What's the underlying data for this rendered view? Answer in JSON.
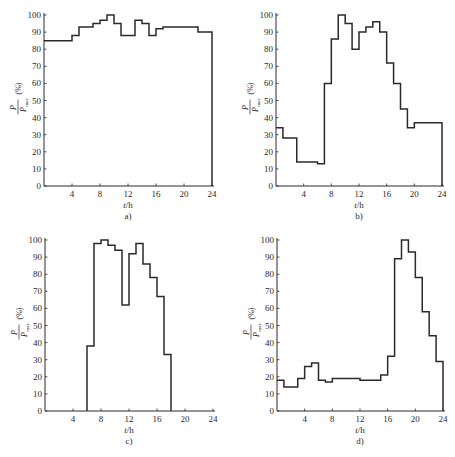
{
  "figure": {
    "caption": "",
    "y_label_numerator": "P",
    "y_label_denominator": "P",
    "y_label_denominator_sub": "max",
    "y_label_unit": "(%)",
    "x_label": "t/h"
  },
  "chart_data": [
    {
      "panel": "a)",
      "type": "line",
      "style": "step",
      "title": "",
      "xlabel": "t/h",
      "ylabel": "P/Pmax (%)",
      "xlim": [
        0,
        24
      ],
      "ylim": [
        0,
        100
      ],
      "xticks": [
        4,
        8,
        12,
        16,
        20,
        24
      ],
      "yticks": [
        0,
        10,
        20,
        30,
        40,
        50,
        60,
        70,
        80,
        90,
        100
      ],
      "grid": false,
      "boxed": true,
      "steps": [
        {
          "t0": 0,
          "t1": 4,
          "value": 85
        },
        {
          "t0": 4,
          "t1": 5,
          "value": 88
        },
        {
          "t0": 5,
          "t1": 7,
          "value": 93
        },
        {
          "t0": 7,
          "t1": 8,
          "value": 95
        },
        {
          "t0": 8,
          "t1": 9,
          "value": 97
        },
        {
          "t0": 9,
          "t1": 10,
          "value": 100
        },
        {
          "t0": 10,
          "t1": 11,
          "value": 95
        },
        {
          "t0": 11,
          "t1": 13,
          "value": 88
        },
        {
          "t0": 13,
          "t1": 14,
          "value": 97
        },
        {
          "t0": 14,
          "t1": 15,
          "value": 95
        },
        {
          "t0": 15,
          "t1": 16,
          "value": 88
        },
        {
          "t0": 16,
          "t1": 17,
          "value": 92
        },
        {
          "t0": 17,
          "t1": 22,
          "value": 93
        },
        {
          "t0": 22,
          "t1": 24,
          "value": 90
        }
      ]
    },
    {
      "panel": "b)",
      "type": "line",
      "style": "step",
      "title": "",
      "xlabel": "t/h",
      "ylabel": "P/Pmax (%)",
      "xlim": [
        0,
        24
      ],
      "ylim": [
        0,
        100
      ],
      "xticks": [
        4,
        8,
        12,
        16,
        20,
        24
      ],
      "yticks": [
        0,
        10,
        20,
        30,
        40,
        50,
        60,
        70,
        80,
        90,
        100
      ],
      "grid": false,
      "boxed": true,
      "steps": [
        {
          "t0": 0,
          "t1": 1,
          "value": 34
        },
        {
          "t0": 1,
          "t1": 3,
          "value": 28
        },
        {
          "t0": 3,
          "t1": 6,
          "value": 14
        },
        {
          "t0": 6,
          "t1": 7,
          "value": 13
        },
        {
          "t0": 7,
          "t1": 8,
          "value": 60
        },
        {
          "t0": 8,
          "t1": 9,
          "value": 86
        },
        {
          "t0": 9,
          "t1": 10,
          "value": 100
        },
        {
          "t0": 10,
          "t1": 11,
          "value": 95
        },
        {
          "t0": 11,
          "t1": 12,
          "value": 80
        },
        {
          "t0": 12,
          "t1": 13,
          "value": 90
        },
        {
          "t0": 13,
          "t1": 14,
          "value": 93
        },
        {
          "t0": 14,
          "t1": 15,
          "value": 96
        },
        {
          "t0": 15,
          "t1": 16,
          "value": 90
        },
        {
          "t0": 16,
          "t1": 17,
          "value": 72
        },
        {
          "t0": 17,
          "t1": 18,
          "value": 60
        },
        {
          "t0": 18,
          "t1": 19,
          "value": 45
        },
        {
          "t0": 19,
          "t1": 20,
          "value": 34
        },
        {
          "t0": 20,
          "t1": 24,
          "value": 37
        }
      ]
    },
    {
      "panel": "c)",
      "type": "line",
      "style": "step",
      "title": "",
      "xlabel": "t/h",
      "ylabel": "P/Pmax (%)",
      "xlim": [
        0,
        24
      ],
      "ylim": [
        0,
        100
      ],
      "xticks": [
        4,
        8,
        12,
        16,
        20,
        24
      ],
      "yticks": [
        0,
        10,
        20,
        30,
        40,
        50,
        60,
        70,
        80,
        90,
        100
      ],
      "grid": false,
      "boxed": false,
      "steps": [
        {
          "t0": 6,
          "t1": 7,
          "value": 38
        },
        {
          "t0": 7,
          "t1": 8,
          "value": 98
        },
        {
          "t0": 8,
          "t1": 9,
          "value": 100
        },
        {
          "t0": 9,
          "t1": 10,
          "value": 97
        },
        {
          "t0": 10,
          "t1": 11,
          "value": 94
        },
        {
          "t0": 11,
          "t1": 12,
          "value": 62
        },
        {
          "t0": 12,
          "t1": 13,
          "value": 92
        },
        {
          "t0": 13,
          "t1": 14,
          "value": 98
        },
        {
          "t0": 14,
          "t1": 15,
          "value": 86
        },
        {
          "t0": 15,
          "t1": 16,
          "value": 78
        },
        {
          "t0": 16,
          "t1": 17,
          "value": 67
        },
        {
          "t0": 17,
          "t1": 18,
          "value": 33
        }
      ]
    },
    {
      "panel": "d)",
      "type": "line",
      "style": "step",
      "title": "",
      "xlabel": "t/h",
      "ylabel": "P/Pmax (%)",
      "xlim": [
        0,
        24
      ],
      "ylim": [
        0,
        100
      ],
      "xticks": [
        4,
        8,
        12,
        16,
        20,
        24
      ],
      "yticks": [
        0,
        10,
        20,
        30,
        40,
        50,
        60,
        70,
        80,
        90,
        100
      ],
      "grid": false,
      "boxed": true,
      "steps": [
        {
          "t0": 0,
          "t1": 1,
          "value": 18
        },
        {
          "t0": 1,
          "t1": 3,
          "value": 14
        },
        {
          "t0": 3,
          "t1": 4,
          "value": 19
        },
        {
          "t0": 4,
          "t1": 5,
          "value": 26
        },
        {
          "t0": 5,
          "t1": 6,
          "value": 28
        },
        {
          "t0": 6,
          "t1": 7,
          "value": 18
        },
        {
          "t0": 7,
          "t1": 8,
          "value": 17
        },
        {
          "t0": 8,
          "t1": 12,
          "value": 19
        },
        {
          "t0": 12,
          "t1": 15,
          "value": 18
        },
        {
          "t0": 15,
          "t1": 16,
          "value": 21
        },
        {
          "t0": 16,
          "t1": 17,
          "value": 32
        },
        {
          "t0": 17,
          "t1": 18,
          "value": 89
        },
        {
          "t0": 18,
          "t1": 19,
          "value": 100
        },
        {
          "t0": 19,
          "t1": 20,
          "value": 93
        },
        {
          "t0": 20,
          "t1": 21,
          "value": 78
        },
        {
          "t0": 21,
          "t1": 22,
          "value": 58
        },
        {
          "t0": 22,
          "t1": 23,
          "value": 44
        },
        {
          "t0": 23,
          "t1": 24,
          "value": 29
        }
      ]
    }
  ]
}
